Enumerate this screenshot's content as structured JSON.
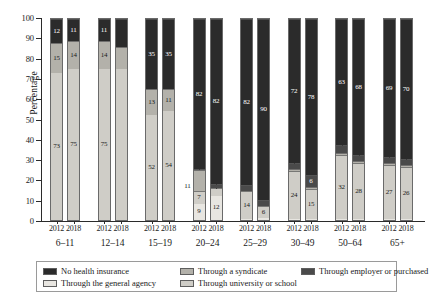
{
  "chart_data": {
    "type": "bar",
    "subtype": "stacked-100-percent",
    "title": "",
    "xlabel": "",
    "ylabel": "Percentage",
    "ylim": [
      0,
      100
    ],
    "yticks": [
      0,
      10,
      20,
      30,
      40,
      50,
      60,
      70,
      80,
      90,
      100
    ],
    "grid": false,
    "legend_position": "bottom",
    "categories": [
      "6–11",
      "12–14",
      "15–19",
      "20–24",
      "25–29",
      "30–49",
      "50–64",
      "65+"
    ],
    "years": [
      "2012",
      "2018"
    ],
    "stack_order_bottom_to_top": [
      "Through the general agency",
      "Through university or school",
      "Through a syndicate",
      "Through employer or purchased",
      "No health insurance"
    ],
    "series": [
      {
        "name": "Through the general agency",
        "color": "#e8e6e1",
        "values_2012": [
          0,
          0,
          0,
          9,
          0,
          0,
          0,
          0
        ],
        "values_2018": [
          0,
          0,
          0,
          12,
          1,
          0,
          0,
          0
        ]
      },
      {
        "name": "Through university or school",
        "color": "#cfcdc7",
        "values_2012": [
          73,
          75,
          52,
          7,
          14,
          24,
          32,
          27
        ],
        "values_2018": [
          75,
          75,
          54,
          4,
          6,
          15,
          28,
          26
        ]
      },
      {
        "name": "Through a syndicate",
        "color": "#b3b1aa",
        "values_2012": [
          15,
          14,
          13,
          11,
          0,
          1,
          1,
          1
        ],
        "values_2018": [
          14,
          11,
          11,
          0,
          0,
          1,
          1,
          1
        ]
      },
      {
        "name": "Through employer or purchased",
        "color": "#4a4a4a",
        "values_2012": [
          0,
          0,
          0,
          0,
          3,
          3,
          4,
          3
        ],
        "values_2018": [
          0,
          0,
          0,
          2,
          3,
          6,
          3,
          3
        ]
      },
      {
        "name": "No health insurance",
        "color": "#2b2b2b",
        "values_2012": [
          12,
          11,
          35,
          82,
          82,
          72,
          63,
          69
        ],
        "values_2018": [
          11,
          14,
          35,
          82,
          90,
          78,
          68,
          70
        ]
      }
    ]
  },
  "axis": {
    "y_title": "Percentage",
    "y_labels": [
      "0",
      "10",
      "20",
      "30",
      "40",
      "50",
      "60",
      "70",
      "80",
      "90",
      "100"
    ]
  },
  "groups": [
    {
      "age": "6–11",
      "bars": [
        {
          "year": "2012",
          "segments": [
            {
              "label": "Through the general agency",
              "value": 0,
              "shown": ""
            },
            {
              "label": "Through university or school",
              "value": 73,
              "shown": "73"
            },
            {
              "label": "Through a syndicate",
              "value": 15,
              "shown": "15"
            },
            {
              "label": "Through employer or purchased",
              "value": 0,
              "shown": ""
            },
            {
              "label": "No health insurance",
              "value": 12,
              "shown": "12"
            }
          ]
        },
        {
          "year": "2018",
          "segments": [
            {
              "label": "Through the general agency",
              "value": 0,
              "shown": ""
            },
            {
              "label": "Through university or school",
              "value": 75,
              "shown": "75"
            },
            {
              "label": "Through a syndicate",
              "value": 14,
              "shown": "14"
            },
            {
              "label": "Through employer or purchased",
              "value": 0,
              "shown": ""
            },
            {
              "label": "No health insurance",
              "value": 11,
              "shown": "11"
            }
          ]
        }
      ]
    },
    {
      "age": "12–14",
      "bars": [
        {
          "year": "2012",
          "segments": [
            {
              "label": "Through the general agency",
              "value": 0,
              "shown": ""
            },
            {
              "label": "Through university or school",
              "value": 75,
              "shown": "75"
            },
            {
              "label": "Through a syndicate",
              "value": 14,
              "shown": "14"
            },
            {
              "label": "Through employer or purchased",
              "value": 0,
              "shown": ""
            },
            {
              "label": "No health insurance",
              "value": 11,
              "shown": "11"
            }
          ]
        },
        {
          "year": "2018",
          "segments": [
            {
              "label": "Through the general agency",
              "value": 0,
              "shown": ""
            },
            {
              "label": "Through university or school",
              "value": 75,
              "shown": ""
            },
            {
              "label": "Through a syndicate",
              "value": 11,
              "shown": ""
            },
            {
              "label": "Through employer or purchased",
              "value": 0,
              "shown": ""
            },
            {
              "label": "No health insurance",
              "value": 14,
              "shown": ""
            }
          ]
        }
      ]
    },
    {
      "age": "15–19",
      "bars": [
        {
          "year": "2012",
          "segments": [
            {
              "label": "Through the general agency",
              "value": 0,
              "shown": ""
            },
            {
              "label": "Through university or school",
              "value": 52,
              "shown": "52"
            },
            {
              "label": "Through a syndicate",
              "value": 13,
              "shown": "13"
            },
            {
              "label": "Through employer or purchased",
              "value": 0,
              "shown": ""
            },
            {
              "label": "No health insurance",
              "value": 35,
              "shown": "35"
            }
          ]
        },
        {
          "year": "2018",
          "segments": [
            {
              "label": "Through the general agency",
              "value": 0,
              "shown": ""
            },
            {
              "label": "Through university or school",
              "value": 54,
              "shown": "54"
            },
            {
              "label": "Through a syndicate",
              "value": 11,
              "shown": "11"
            },
            {
              "label": "Through employer or purchased",
              "value": 0,
              "shown": ""
            },
            {
              "label": "No health insurance",
              "value": 35,
              "shown": "35"
            }
          ]
        }
      ]
    },
    {
      "age": "20–24",
      "bars": [
        {
          "year": "2012",
          "segments": [
            {
              "label": "Through the general agency",
              "value": 9,
              "shown": "9"
            },
            {
              "label": "Through university or school",
              "value": 7,
              "shown": "7"
            },
            {
              "label": "Through a syndicate",
              "value": 11,
              "shown": "11"
            },
            {
              "label": "Through employer or purchased",
              "value": 0,
              "shown": "0"
            },
            {
              "label": "No health insurance",
              "value": 82,
              "shown": "82"
            }
          ]
        },
        {
          "year": "2018",
          "segments": [
            {
              "label": "Through the general agency",
              "value": 12,
              "shown": "12"
            },
            {
              "label": "Through university or school",
              "value": 4,
              "shown": "4"
            },
            {
              "label": "Through a syndicate",
              "value": 0,
              "shown": ""
            },
            {
              "label": "Through employer or purchased",
              "value": 2,
              "shown": "0"
            },
            {
              "label": "No health insurance",
              "value": 82,
              "shown": "82"
            }
          ]
        }
      ]
    },
    {
      "age": "25–29",
      "bars": [
        {
          "year": "2012",
          "segments": [
            {
              "label": "Through the general agency",
              "value": 0,
              "shown": "0"
            },
            {
              "label": "Through university or school",
              "value": 14,
              "shown": "14"
            },
            {
              "label": "Through a syndicate",
              "value": 0,
              "shown": ""
            },
            {
              "label": "Through employer or purchased",
              "value": 3,
              "shown": ""
            },
            {
              "label": "No health insurance",
              "value": 82,
              "shown": "82"
            }
          ]
        },
        {
          "year": "2018",
          "segments": [
            {
              "label": "Through the general agency",
              "value": 1,
              "shown": "1"
            },
            {
              "label": "Through university or school",
              "value": 6,
              "shown": "6"
            },
            {
              "label": "Through a syndicate",
              "value": 0,
              "shown": ""
            },
            {
              "label": "Through employer or purchased",
              "value": 3,
              "shown": ""
            },
            {
              "label": "No health insurance",
              "value": 90,
              "shown": "90"
            }
          ]
        }
      ]
    },
    {
      "age": "30–49",
      "bars": [
        {
          "year": "2012",
          "segments": [
            {
              "label": "Through the general agency",
              "value": 0,
              "shown": "0"
            },
            {
              "label": "Through university or school",
              "value": 24,
              "shown": "24"
            },
            {
              "label": "Through a syndicate",
              "value": 1,
              "shown": ""
            },
            {
              "label": "Through employer or purchased",
              "value": 3,
              "shown": "3"
            },
            {
              "label": "No health insurance",
              "value": 72,
              "shown": "72"
            }
          ]
        },
        {
          "year": "2018",
          "segments": [
            {
              "label": "Through the general agency",
              "value": 0,
              "shown": "0"
            },
            {
              "label": "Through university or school",
              "value": 15,
              "shown": "15"
            },
            {
              "label": "Through a syndicate",
              "value": 1,
              "shown": ""
            },
            {
              "label": "Through employer or purchased",
              "value": 6,
              "shown": "6"
            },
            {
              "label": "No health insurance",
              "value": 78,
              "shown": "78"
            }
          ]
        }
      ]
    },
    {
      "age": "50–64",
      "bars": [
        {
          "year": "2012",
          "segments": [
            {
              "label": "Through the general agency",
              "value": 0,
              "shown": "0"
            },
            {
              "label": "Through university or school",
              "value": 32,
              "shown": "32"
            },
            {
              "label": "Through a syndicate",
              "value": 1,
              "shown": ""
            },
            {
              "label": "Through employer or purchased",
              "value": 4,
              "shown": "4"
            },
            {
              "label": "No health insurance",
              "value": 63,
              "shown": "63"
            }
          ]
        },
        {
          "year": "2018",
          "segments": [
            {
              "label": "Through the general agency",
              "value": 0,
              "shown": "0"
            },
            {
              "label": "Through university or school",
              "value": 28,
              "shown": "28"
            },
            {
              "label": "Through a syndicate",
              "value": 1,
              "shown": ""
            },
            {
              "label": "Through employer or purchased",
              "value": 3,
              "shown": "3"
            },
            {
              "label": "No health insurance",
              "value": 68,
              "shown": "68"
            }
          ]
        }
      ]
    },
    {
      "age": "65+",
      "bars": [
        {
          "year": "2012",
          "segments": [
            {
              "label": "Through the general agency",
              "value": 0,
              "shown": "0"
            },
            {
              "label": "Through university or school",
              "value": 27,
              "shown": "27"
            },
            {
              "label": "Through a syndicate",
              "value": 1,
              "shown": ""
            },
            {
              "label": "Through employer or purchased",
              "value": 3,
              "shown": "3"
            },
            {
              "label": "No health insurance",
              "value": 69,
              "shown": "69"
            }
          ]
        },
        {
          "year": "2018",
          "segments": [
            {
              "label": "Through the general agency",
              "value": 0,
              "shown": "0"
            },
            {
              "label": "Through university or school",
              "value": 26,
              "shown": "26"
            },
            {
              "label": "Through a syndicate",
              "value": 1,
              "shown": ""
            },
            {
              "label": "Through employer or purchased",
              "value": 3,
              "shown": "3"
            },
            {
              "label": "No health insurance",
              "value": 70,
              "shown": "70"
            }
          ]
        }
      ]
    }
  ],
  "legend": {
    "items": [
      {
        "label": "No health insurance",
        "color": "#2b2b2b"
      },
      {
        "label": "Through a syndicate",
        "color": "#b3b1aa"
      },
      {
        "label": "Through employer or purchased",
        "color": "#4a4a4a"
      },
      {
        "label": "Through the general agency",
        "color": "#e8e6e1"
      },
      {
        "label": "Through university or school",
        "color": "#cfcdc7"
      }
    ]
  }
}
